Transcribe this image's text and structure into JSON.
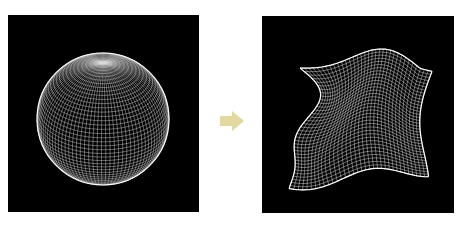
{
  "figure": {
    "left_panel": {
      "label": "Wireframe sphere",
      "background": "#000000",
      "mesh_color": "#ffffff",
      "shape": "sphere"
    },
    "arrow": {
      "label": "transforms into",
      "color": "#e3d9a0",
      "direction": "right"
    },
    "right_panel": {
      "label": "Deformed wireframe mesh",
      "background": "#000000",
      "mesh_color": "#ffffff",
      "shape": "deformed-surface"
    }
  }
}
